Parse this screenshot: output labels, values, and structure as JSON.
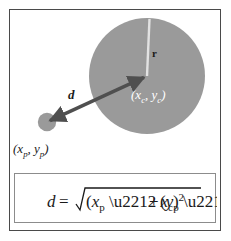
{
  "diagram": {
    "title_visible": false,
    "colors": {
      "frame_border": "#4a4a4a",
      "background": "#ffffff",
      "circle_fill": "#9a9a9a",
      "point_fill": "#9a9a9a",
      "arrow": "#4f4f4f",
      "radius_line": "#e2e2e2",
      "center_label_text": "#ffffff",
      "point_label_text": "#1a1a1a",
      "formula_box_border": "#8c8c8c"
    },
    "big_circle": {
      "name": "circle-shape",
      "center_x": 147,
      "center_y": 76,
      "radius": 58
    },
    "point_marker": {
      "name": "point-marker",
      "center_x": 47,
      "center_y": 122,
      "radius": 9
    },
    "distance_arrow": {
      "name": "distance-arrow",
      "from_x": 47,
      "from_y": 122,
      "to_x": 147,
      "to_y": 76,
      "double_headed": true
    },
    "radius_line": {
      "name": "radius-line",
      "from_x": 147,
      "from_y": 76,
      "to_x": 149,
      "to_y": 19
    },
    "labels": {
      "center": "(x_c, y_c)",
      "center_base": "(",
      "center_x_var": "x",
      "center_x_sub": "c",
      "center_comma": ", ",
      "center_y_var": "y",
      "center_y_sub": "c",
      "center_close": ")",
      "point": "(x_p, y_p)",
      "distance": "d",
      "radius": "r"
    },
    "formula": {
      "name": "distance-formula",
      "text": "d = sqrt((x_p - x_c)^2 + (y_p - y_c)^2)",
      "lhs": "d",
      "equals": "=",
      "radicand_left": "(x_p − x_c)",
      "exponent_left": "2",
      "plus": "+",
      "radicand_right": "(y_p − y_c)",
      "exponent_right": "2"
    }
  }
}
